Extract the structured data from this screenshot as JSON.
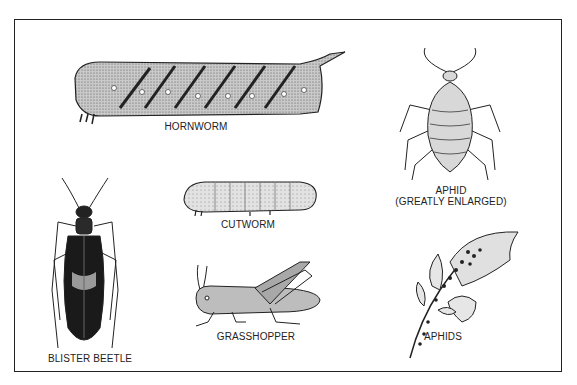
{
  "figure": {
    "insects": [
      {
        "name": "hornworm",
        "label": "HORNWORM"
      },
      {
        "name": "aphid",
        "label": "APHID",
        "sublabel": "(GREATLY ENLARGED)"
      },
      {
        "name": "cutworm",
        "label": "CUTWORM"
      },
      {
        "name": "blister-beetle",
        "label": "BLISTER BEETLE"
      },
      {
        "name": "grasshopper",
        "label": "GRASSHOPPER"
      },
      {
        "name": "aphids-on-plant",
        "label": "APHIDS"
      }
    ]
  }
}
